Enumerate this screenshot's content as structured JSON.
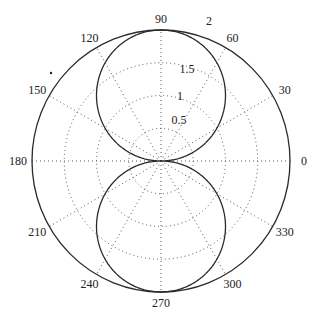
{
  "chart_data": {
    "type": "polar-line",
    "title": "",
    "function": "r = 2*|sin(theta)|",
    "angle_tick_labels": [
      "0",
      "30",
      "60",
      "90",
      "120",
      "150",
      "180",
      "210",
      "240",
      "270",
      "300",
      "330"
    ],
    "angle_ticks_deg": [
      0,
      30,
      60,
      90,
      120,
      150,
      180,
      210,
      240,
      270,
      300,
      330
    ],
    "radial_tick_labels": [
      "0.5",
      "1",
      "1.5",
      "2"
    ],
    "radial_ticks": [
      0.5,
      1,
      1.5,
      2
    ],
    "rlim": [
      0,
      2
    ],
    "grid": "dotted",
    "series": [
      {
        "name": "r(theta)",
        "theta_deg": [
          0,
          15,
          30,
          45,
          60,
          75,
          90,
          105,
          120,
          135,
          150,
          165,
          180,
          195,
          210,
          225,
          240,
          255,
          270,
          285,
          300,
          315,
          330,
          345,
          360
        ],
        "r": [
          0,
          0.52,
          1.0,
          1.41,
          1.73,
          1.93,
          2.0,
          1.93,
          1.73,
          1.41,
          1.0,
          0.52,
          0,
          0.52,
          1.0,
          1.41,
          1.73,
          1.93,
          2.0,
          1.93,
          1.73,
          1.41,
          1.0,
          0.52,
          0
        ]
      }
    ],
    "legend": null
  },
  "colors": {
    "curve": "#2a2a2a",
    "outer_circle": "#2a2a2a",
    "grid": "#555555",
    "background": "#ffffff"
  }
}
